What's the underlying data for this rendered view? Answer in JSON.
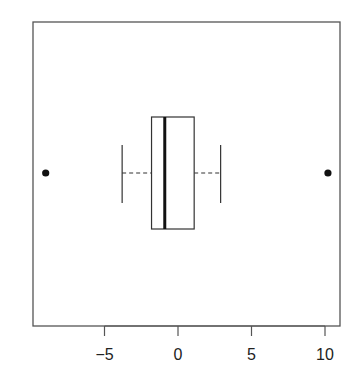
{
  "chart_data": {
    "type": "boxplot",
    "orientation": "horizontal",
    "title": "",
    "xlabel": "",
    "ylabel": "",
    "xlim": [
      -9.5,
      10.8
    ],
    "x_ticks": [
      -5,
      0,
      5,
      10
    ],
    "x_tick_labels": [
      "−5",
      "0",
      "5",
      "10"
    ],
    "grid": false,
    "legend": null,
    "series": [
      {
        "name": "",
        "whisker_low": -3.8,
        "q1": -1.8,
        "median": -0.9,
        "q3": 1.1,
        "whisker_high": 2.9,
        "outliers": [
          -9.0,
          10.2
        ]
      }
    ]
  }
}
